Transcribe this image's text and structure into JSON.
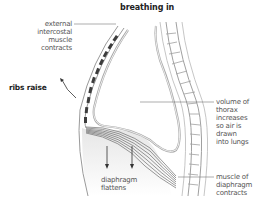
{
  "title": "breathing in",
  "labels": {
    "external_intercostal": [
      "external",
      "intercostal",
      "muscle",
      "contracts"
    ],
    "ribs_raise": "ribs raise",
    "volume_of_thorax": [
      "volume of",
      "thorax",
      "increases",
      "so air is",
      "drawn",
      "into lungs"
    ],
    "muscle_of_diaphragm": [
      "muscle of",
      "diaphragm",
      "contracts"
    ],
    "diaphragm_flattens": [
      "diaphragm",
      "flattens"
    ]
  },
  "colors": {
    "outline": "#9a9a9a",
    "rib_muscle": "#444444",
    "diaphragm_muscle": "#555555",
    "abdomen_fill": "#eeeeee",
    "text": "#555555",
    "leader_line": "#777777"
  }
}
